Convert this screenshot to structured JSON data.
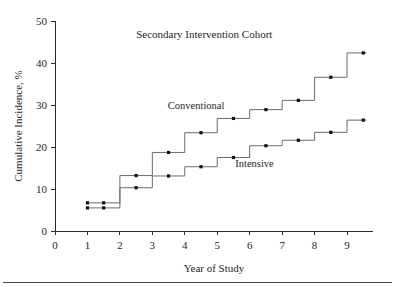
{
  "figure": {
    "background_color": "#ffffff",
    "line_color": "#6b6b6b",
    "marker_color": "#101010",
    "axis_color": "#2b2b2b",
    "bottom_rule": true
  },
  "chart_data": {
    "type": "line",
    "subtype": "step-cumulative-incidence",
    "title": "Secondary Intervention Cohort",
    "xlabel": "Year of Study",
    "ylabel": "Cumulative Incidence, %",
    "xlim": [
      0,
      9.8
    ],
    "ylim": [
      0,
      50
    ],
    "xticks": [
      0,
      1,
      2,
      3,
      4,
      5,
      6,
      7,
      8,
      9
    ],
    "xtick_labels": [
      "0",
      "1",
      "2",
      "3",
      "4",
      "5",
      "6",
      "7",
      "8",
      "9"
    ],
    "yticks": [
      0,
      10,
      20,
      30,
      40,
      50
    ],
    "ytick_labels": [
      "0",
      "10",
      "20",
      "30",
      "40",
      "50"
    ],
    "grid": false,
    "legend": "inline-annotations",
    "series": [
      {
        "name": "Conventional",
        "label_x": 4.35,
        "label_y": 29.0,
        "points": [
          {
            "x": 1.0,
            "y": 6.7
          },
          {
            "x": 1.5,
            "y": 6.7
          },
          {
            "x": 2.5,
            "y": 13.2
          },
          {
            "x": 3.5,
            "y": 18.7
          },
          {
            "x": 4.5,
            "y": 23.4
          },
          {
            "x": 5.5,
            "y": 26.8
          },
          {
            "x": 6.5,
            "y": 28.9
          },
          {
            "x": 7.5,
            "y": 31.1
          },
          {
            "x": 8.5,
            "y": 36.6
          },
          {
            "x": 9.5,
            "y": 42.4
          }
        ],
        "step_breaks": [
          2.0,
          3.0,
          4.0,
          5.0,
          6.0,
          7.0,
          8.0,
          9.0
        ],
        "step_values": [
          6.7,
          13.2,
          18.7,
          23.4,
          26.8,
          28.9,
          31.1,
          36.6,
          42.4
        ],
        "start_x": 1.0,
        "end_x": 9.6
      },
      {
        "name": "Intensive",
        "label_x": 6.15,
        "label_y": 15.2,
        "points": [
          {
            "x": 1.0,
            "y": 5.5
          },
          {
            "x": 1.5,
            "y": 5.5
          },
          {
            "x": 2.5,
            "y": 10.3
          },
          {
            "x": 3.5,
            "y": 13.1
          },
          {
            "x": 4.5,
            "y": 15.3
          },
          {
            "x": 5.5,
            "y": 17.5
          },
          {
            "x": 6.5,
            "y": 20.3
          },
          {
            "x": 7.5,
            "y": 21.6
          },
          {
            "x": 8.5,
            "y": 23.5
          },
          {
            "x": 9.5,
            "y": 26.4
          }
        ],
        "step_breaks": [
          2.0,
          3.0,
          4.0,
          5.0,
          6.0,
          7.0,
          8.0,
          9.0
        ],
        "step_values": [
          5.5,
          10.3,
          13.1,
          15.3,
          17.5,
          20.3,
          21.6,
          23.5,
          26.4
        ],
        "start_x": 1.0,
        "end_x": 9.6
      }
    ]
  }
}
